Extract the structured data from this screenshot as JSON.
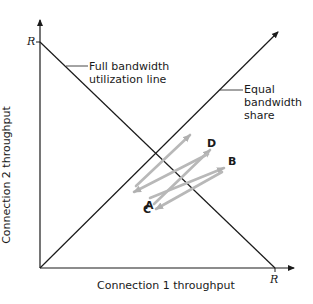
{
  "diagram": {
    "type": "tcp-fairness-throughput-plot",
    "axes": {
      "x_label": "Connection 1 throughput",
      "y_label": "Connection 2 throughput",
      "x_max_label": "R",
      "y_max_label": "R"
    },
    "lines": {
      "full_bandwidth": "Full bandwidth\nutilization line",
      "full_bandwidth_line1": "Full bandwidth",
      "full_bandwidth_line2": "utilization line",
      "equal_share_line1": "Equal",
      "equal_share_line2": "bandwidth",
      "equal_share_line3": "share"
    },
    "points": {
      "A": "A",
      "B": "B",
      "C": "C",
      "D": "D"
    },
    "colors": {
      "axis": "#1a1a1a",
      "trajectory": "#b8b8b8"
    }
  }
}
